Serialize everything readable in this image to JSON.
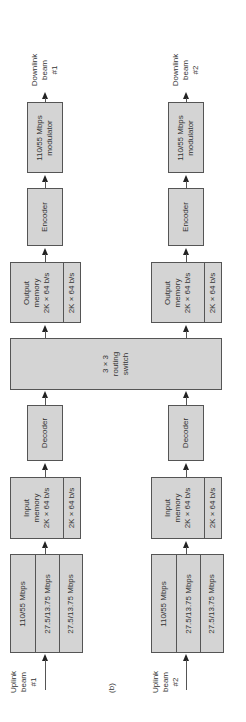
{
  "figure_label": "(b)",
  "routing_switch": {
    "lines": [
      "3 × 3",
      "routing",
      "switch"
    ]
  },
  "beams": [
    {
      "id": 1,
      "uplink_label": [
        "Uplink",
        "beam",
        "#1"
      ],
      "downlink_label": [
        "Downlink",
        "beam",
        "#1"
      ],
      "receiver": {
        "rows": [
          "110/55 Mbps",
          "27.5/13.75 Mbps",
          "27.5/13.75 Mbps"
        ]
      },
      "input_memory": {
        "main": [
          "Input",
          "memory",
          "2K × 64 b/s"
        ],
        "side": "2K × 64 b/s"
      },
      "decoder": "Decoder",
      "output_memory": {
        "main": [
          "Output",
          "memory",
          "2K × 64 b/s"
        ],
        "side": "2K × 64 b/s"
      },
      "encoder": "Encoder",
      "modulator": [
        "110/55 Mbps",
        "modulator"
      ]
    },
    {
      "id": 2,
      "uplink_label": [
        "Uplink",
        "beam",
        "#2"
      ],
      "downlink_label": [
        "Downlink",
        "beam",
        "#2"
      ],
      "receiver": {
        "rows": [
          "110/55 Mbps",
          "27.5/13.75 Mbps",
          "27.5/13.75 Mbps"
        ]
      },
      "input_memory": {
        "main": [
          "Input",
          "memory",
          "2K × 64 b/s"
        ],
        "side": "2K × 64 b/s"
      },
      "decoder": "Decoder",
      "output_memory": {
        "main": [
          "Output",
          "memory",
          "2K × 64 b/s"
        ],
        "side": "2K × 64 b/s"
      },
      "encoder": "Encoder",
      "modulator": [
        "110/55 Mbps",
        "modulator"
      ]
    }
  ],
  "colors": {
    "block_fill": "#d4d4d4",
    "block_border": "#555555",
    "line": "#555555",
    "background": "#ffffff"
  }
}
